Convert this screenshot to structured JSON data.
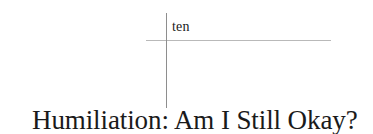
{
  "page": {
    "background_color": "#ffffff",
    "text_color": "#1a1a1a"
  },
  "chapter": {
    "number_label": "ten",
    "title": "Humiliation: Am I Still Okay?"
  },
  "rules": {
    "horizontal_color": "#b9b9b9",
    "vertical_color": "#8e8e8e"
  }
}
